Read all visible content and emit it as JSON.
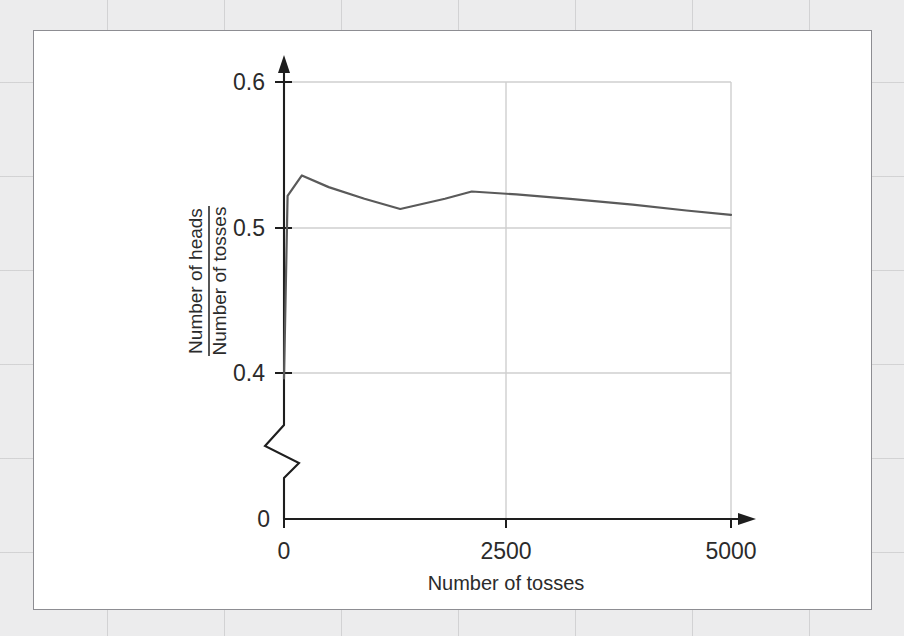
{
  "figure": {
    "background_color": "#ececed",
    "panel_color": "#ffffff",
    "panel_border_color": "#8d8d92",
    "line_color": "#5a5a5a",
    "grid_color": "#cfcfcf",
    "axis_color": "#1e1e1e"
  },
  "chart_data": {
    "type": "line",
    "title": "",
    "subtitle": "",
    "xlabel": "Number of tosses",
    "ylabel_numerator": "Number of heads",
    "ylabel_denominator": "Number of tosses",
    "ylabel": "Number of heads / Number of tosses",
    "x_ticks": [
      0,
      2500,
      5000
    ],
    "x_tick_labels": [
      "0",
      "2500",
      "5000"
    ],
    "y_ticks": [
      0,
      0.4,
      0.5,
      0.6
    ],
    "y_tick_labels": [
      "0",
      "0.4",
      "0.5",
      "0.6"
    ],
    "xlim": [
      0,
      5000
    ],
    "ylim": [
      0.37,
      0.615
    ],
    "y_axis_break": true,
    "y_axis_break_note": "zigzag break between 0 and 0.4",
    "grid": true,
    "grid_lines_x": [
      2500,
      5000
    ],
    "grid_lines_y": [
      0.4,
      0.5,
      0.6
    ],
    "legend": "none",
    "series": [
      {
        "name": "Proportion of heads",
        "x": [
          0,
          40,
          200,
          500,
          900,
          1300,
          1800,
          2100,
          2600,
          3200,
          3900,
          4500,
          5000
        ],
        "values": [
          0.603,
          0.478,
          0.464,
          0.472,
          0.48,
          0.487,
          0.48,
          0.475,
          0.477,
          0.48,
          0.484,
          0.488,
          0.491
        ]
      }
    ],
    "annotations": [
      {
        "text": "curve converges toward 0.5 as number of tosses increases"
      }
    ]
  },
  "axis_labels": {
    "x_tick_0": "0",
    "x_tick_2500": "2500",
    "x_tick_5000": "5000",
    "y_tick_0": "0",
    "y_tick_04": "0.4",
    "y_tick_05": "0.5",
    "y_tick_06": "0.6",
    "x_axis_title": "Number of tosses",
    "y_axis_numerator": "Number of heads",
    "y_axis_denominator": "Number of tosses"
  }
}
